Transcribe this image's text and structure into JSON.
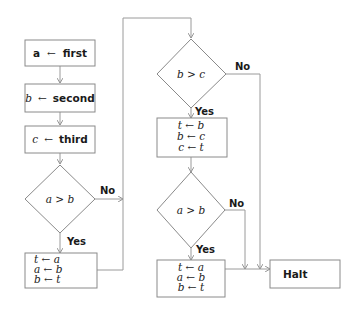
{
  "diagram": {
    "type": "flowchart",
    "nodes": {
      "assign_a": {
        "var": "a",
        "arrow": "←",
        "value": "first"
      },
      "assign_b": {
        "var": "b",
        "arrow": "←",
        "value": "second"
      },
      "assign_c": {
        "var": "c",
        "arrow": "←",
        "value": "third"
      },
      "cond1": {
        "text": "a > b"
      },
      "swap1": {
        "lines": [
          "t ← a",
          "a ← b",
          "b ← t"
        ]
      },
      "cond2": {
        "text": "b > c"
      },
      "swap2": {
        "lines": [
          "t ← b",
          "b ← c",
          "c ← t"
        ]
      },
      "cond3": {
        "text": "a > b"
      },
      "swap3": {
        "lines": [
          "t ← a",
          "a ← b",
          "b ← t"
        ]
      },
      "halt": {
        "text": "Halt"
      }
    },
    "edges": {
      "cond1_yes": "Yes",
      "cond1_no": "No",
      "cond2_yes": "Yes",
      "cond2_no": "No",
      "cond3_yes": "Yes",
      "cond3_no": "No"
    }
  }
}
